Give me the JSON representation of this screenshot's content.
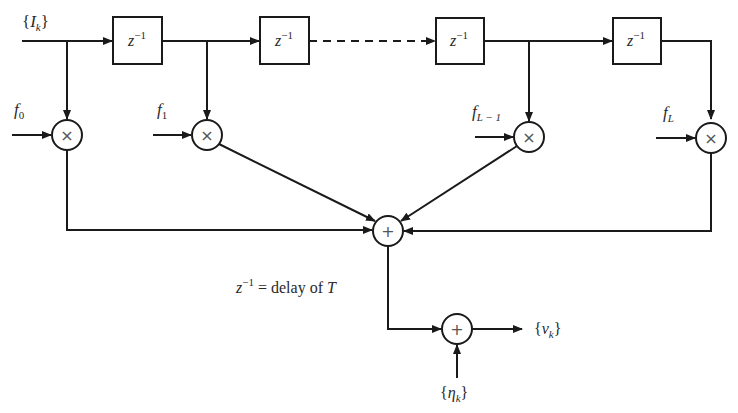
{
  "diagram": {
    "type": "tapped-delay-line FIR channel model",
    "input_label": "{I_k}",
    "input": {
      "brace_open": "{",
      "sym": "I",
      "sub": "k",
      "brace_close": "}"
    },
    "delay_boxes": [
      {
        "base": "z",
        "sup": "−1"
      },
      {
        "base": "z",
        "sup": "−1"
      },
      {
        "base": "z",
        "sup": "−1"
      },
      {
        "base": "z",
        "sup": "−1"
      }
    ],
    "taps": [
      {
        "sym": "f",
        "sub": "0",
        "op": "×"
      },
      {
        "sym": "f",
        "sub": "1",
        "op": "×"
      },
      {
        "sym": "f",
        "sub": "L − 1",
        "op": "×"
      },
      {
        "sym": "f",
        "sub": "L",
        "op": "×"
      }
    ],
    "summer_op": "+",
    "noise_adder_op": "+",
    "note": {
      "base": "z",
      "sup": "−1",
      "text": " = delay of ",
      "var": "T"
    },
    "noise": {
      "brace_open": "{",
      "sym": "η",
      "sub": "k",
      "brace_close": "}"
    },
    "output": {
      "brace_open": "{",
      "sym": "v",
      "sub": "k",
      "brace_close": "}"
    },
    "colors": {
      "line": "#1a1a1a",
      "text": "#2a2a2a",
      "background": "#ffffff"
    }
  }
}
